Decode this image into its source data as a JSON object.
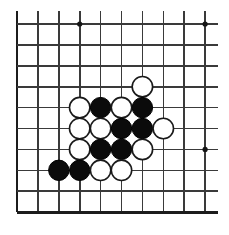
{
  "app": {
    "title": "Go Board Position",
    "board_type": "go-goban",
    "background_color": "#ffffff"
  },
  "board": {
    "visible_columns": 10,
    "visible_rows": 10,
    "origin_x": 17,
    "origin_y": 24,
    "cell_size": 20.9,
    "line_color": "#3a3a3a",
    "edge_color": "#1c1c1c",
    "edge_lines": {
      "left": true,
      "right": false,
      "top": false,
      "bottom": true
    },
    "star_points": [
      {
        "col": 3,
        "row": 0
      },
      {
        "col": 9,
        "row": 0
      },
      {
        "col": 9,
        "row": 6
      }
    ],
    "star_color": "#151515"
  },
  "stones": {
    "black_color": "#0b0b0b",
    "white_color": "#ffffff",
    "radius": 10.2,
    "black_count": 8,
    "white_count": 10,
    "list": [
      {
        "color": "white",
        "col": 6,
        "row": 3
      },
      {
        "color": "white",
        "col": 3,
        "row": 4
      },
      {
        "color": "black",
        "col": 4,
        "row": 4
      },
      {
        "color": "white",
        "col": 5,
        "row": 4
      },
      {
        "color": "black",
        "col": 6,
        "row": 4
      },
      {
        "color": "white",
        "col": 3,
        "row": 5
      },
      {
        "color": "white",
        "col": 4,
        "row": 5
      },
      {
        "color": "black",
        "col": 5,
        "row": 5
      },
      {
        "color": "black",
        "col": 6,
        "row": 5
      },
      {
        "color": "white",
        "col": 7,
        "row": 5
      },
      {
        "color": "white",
        "col": 3,
        "row": 6
      },
      {
        "color": "black",
        "col": 4,
        "row": 6
      },
      {
        "color": "black",
        "col": 5,
        "row": 6
      },
      {
        "color": "white",
        "col": 6,
        "row": 6
      },
      {
        "color": "black",
        "col": 2,
        "row": 7
      },
      {
        "color": "black",
        "col": 3,
        "row": 7
      },
      {
        "color": "white",
        "col": 4,
        "row": 7
      },
      {
        "color": "white",
        "col": 5,
        "row": 7
      }
    ]
  }
}
